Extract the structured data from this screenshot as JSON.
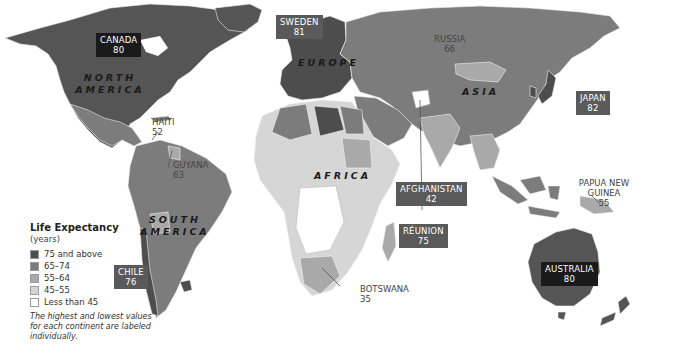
{
  "legend": {
    "title": "Life Expectancy",
    "subtitle": "(years)",
    "items": [
      {
        "label": "75 and above",
        "color": "#4d4d4d"
      },
      {
        "label": "65–74",
        "color": "#7c7c7c"
      },
      {
        "label": "55–64",
        "color": "#a9a9a9"
      },
      {
        "label": "45–55",
        "color": "#d6d6d6"
      },
      {
        "label": "Less than 45",
        "color": "#ffffff"
      }
    ],
    "note": "The highest and lowest values for each continent are labeled individually."
  },
  "continents": {
    "north_america": "NORTH AMERICA",
    "south_america": "SOUTH AMERICA",
    "europe": "EUROPE",
    "asia": "ASIA",
    "africa": "AFRICA"
  },
  "countries": {
    "canada": {
      "name": "CANADA",
      "value": "80"
    },
    "haiti": {
      "name": "HAITI",
      "value": "52"
    },
    "guyana": {
      "name": "GUYANA",
      "value": "63"
    },
    "chile": {
      "name": "CHILE",
      "value": "76"
    },
    "sweden": {
      "name": "SWEDEN",
      "value": "81"
    },
    "russia": {
      "name": "RUSSIA",
      "value": "66"
    },
    "japan": {
      "name": "JAPAN",
      "value": "82"
    },
    "afghanistan": {
      "name": "AFGHANISTAN",
      "value": "42"
    },
    "reunion": {
      "name": "RÉUNION",
      "value": "75"
    },
    "botswana": {
      "name": "BOTSWANA",
      "value": "35"
    },
    "papua_new_guinea": {
      "name": "PAPUA NEW GUINEA",
      "value": "55"
    },
    "australia": {
      "name": "AUSTRALIA",
      "value": "80"
    }
  }
}
